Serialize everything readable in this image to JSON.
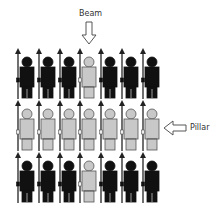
{
  "diagram": {
    "labels": {
      "beam": "Beam",
      "pillar": "Pillar"
    },
    "colors": {
      "dark_figure": "#111111",
      "light_figure": "#c8c8c8",
      "light_outline": "#555555",
      "spear": "#222222",
      "arrow_fill": "#ffffff",
      "arrow_stroke": "#444444",
      "text": "#333333"
    },
    "grid": {
      "rows": 3,
      "columns": 7,
      "highlighted_column": 4,
      "highlighted_row": 2,
      "cells": [
        [
          "dark",
          "dark",
          "dark",
          "light",
          "dark",
          "dark",
          "dark"
        ],
        [
          "light",
          "light",
          "light",
          "light",
          "light",
          "light",
          "light"
        ],
        [
          "dark",
          "dark",
          "dark",
          "light",
          "dark",
          "dark",
          "dark"
        ]
      ]
    },
    "annotations": [
      {
        "label": "Beam",
        "points_to": "column 4",
        "arrow_direction": "down"
      },
      {
        "label": "Pillar",
        "points_to": "row 2",
        "arrow_direction": "left"
      }
    ]
  }
}
